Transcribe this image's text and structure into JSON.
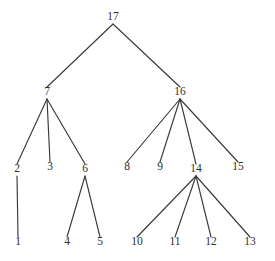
{
  "figure": {
    "type": "tree-diagram",
    "title": "",
    "width": 275,
    "height": 261,
    "background_color": "#ffffff",
    "edge_color": "#3a3a3a",
    "label_color": "#2e2e2e"
  },
  "chart_data": {
    "type": "diagram",
    "subtype": "rooted-tree",
    "title": "",
    "root": "17",
    "node_count": 17,
    "edge_count": 16,
    "nodes": [
      {
        "id": "17",
        "label": "17",
        "x": 113,
        "y": 20,
        "depth": 0,
        "parent": null,
        "children": [
          "7",
          "16"
        ]
      },
      {
        "id": "7",
        "label": "7",
        "x": 47,
        "y": 95,
        "depth": 1,
        "parent": "17",
        "children": [
          "2",
          "3",
          "6"
        ]
      },
      {
        "id": "16",
        "label": "16",
        "x": 180,
        "y": 95,
        "depth": 1,
        "parent": "17",
        "children": [
          "8",
          "9",
          "14",
          "15"
        ]
      },
      {
        "id": "2",
        "label": "2",
        "x": 17,
        "y": 172,
        "depth": 2,
        "parent": "7",
        "children": [
          "1"
        ]
      },
      {
        "id": "3",
        "label": "3",
        "x": 50,
        "y": 170,
        "depth": 2,
        "parent": "7",
        "children": []
      },
      {
        "id": "6",
        "label": "6",
        "x": 85,
        "y": 172,
        "depth": 2,
        "parent": "7",
        "children": [
          "4",
          "5"
        ]
      },
      {
        "id": "8",
        "label": "8",
        "x": 127,
        "y": 170,
        "depth": 2,
        "parent": "16",
        "children": []
      },
      {
        "id": "9",
        "label": "9",
        "x": 160,
        "y": 170,
        "depth": 2,
        "parent": "16",
        "children": []
      },
      {
        "id": "14",
        "label": "14",
        "x": 196,
        "y": 172,
        "depth": 2,
        "parent": "16",
        "children": [
          "10",
          "11",
          "12",
          "13"
        ]
      },
      {
        "id": "15",
        "label": "15",
        "x": 238,
        "y": 170,
        "depth": 2,
        "parent": "16",
        "children": []
      },
      {
        "id": "1",
        "label": "1",
        "x": 18,
        "y": 245,
        "depth": 3,
        "parent": "2",
        "children": []
      },
      {
        "id": "4",
        "label": "4",
        "x": 67,
        "y": 245,
        "depth": 3,
        "parent": "6",
        "children": []
      },
      {
        "id": "5",
        "label": "5",
        "x": 100,
        "y": 245,
        "depth": 3,
        "parent": "6",
        "children": []
      },
      {
        "id": "10",
        "label": "10",
        "x": 137,
        "y": 245,
        "depth": 3,
        "parent": "14",
        "children": []
      },
      {
        "id": "11",
        "label": "11",
        "x": 175,
        "y": 245,
        "depth": 3,
        "parent": "14",
        "children": []
      },
      {
        "id": "12",
        "label": "12",
        "x": 211,
        "y": 245,
        "depth": 3,
        "parent": "14",
        "children": []
      },
      {
        "id": "13",
        "label": "13",
        "x": 250,
        "y": 245,
        "depth": 3,
        "parent": "14",
        "children": []
      }
    ],
    "edges": [
      {
        "from": "17",
        "to": "7"
      },
      {
        "from": "17",
        "to": "16"
      },
      {
        "from": "7",
        "to": "2"
      },
      {
        "from": "7",
        "to": "3"
      },
      {
        "from": "7",
        "to": "6"
      },
      {
        "from": "2",
        "to": "1"
      },
      {
        "from": "6",
        "to": "4"
      },
      {
        "from": "6",
        "to": "5"
      },
      {
        "from": "16",
        "to": "8"
      },
      {
        "from": "16",
        "to": "9"
      },
      {
        "from": "16",
        "to": "14"
      },
      {
        "from": "16",
        "to": "15"
      },
      {
        "from": "14",
        "to": "10"
      },
      {
        "from": "14",
        "to": "11"
      },
      {
        "from": "14",
        "to": "12"
      },
      {
        "from": "14",
        "to": "13"
      }
    ],
    "leaves": [
      "3",
      "8",
      "9",
      "15",
      "1",
      "4",
      "5",
      "10",
      "11",
      "12",
      "13"
    ],
    "depth_levels": 4,
    "label_position": "above-node"
  }
}
